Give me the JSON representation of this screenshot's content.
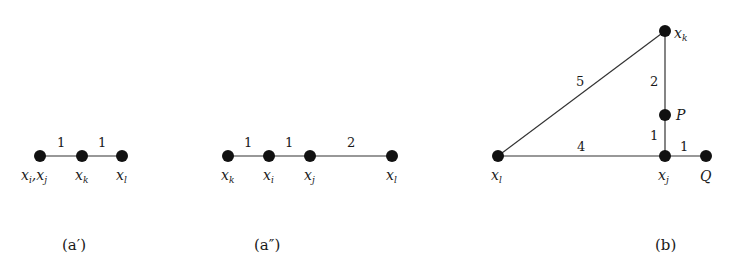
{
  "figures": [
    {
      "id": "a_prime",
      "caption": "(a′)",
      "caption_pos": [
        75,
        246
      ],
      "nodes": [
        {
          "id": "xij",
          "x": 40,
          "y": 156,
          "label": "xi,xj",
          "label_html": [
            "x",
            "i",
            ",x",
            "j"
          ],
          "lx": 22,
          "ly": 178
        },
        {
          "id": "xk",
          "x": 82,
          "y": 156,
          "label": "xk",
          "lx": 76,
          "ly": 178
        },
        {
          "id": "xl",
          "x": 122,
          "y": 156,
          "label": "xl",
          "lx": 116,
          "ly": 178
        }
      ],
      "edges": [
        {
          "from": "xij",
          "to": "xk",
          "weight": "1",
          "wx": 61,
          "wy": 148
        },
        {
          "from": "xk",
          "to": "xl",
          "weight": "1",
          "wx": 102,
          "wy": 148
        }
      ]
    },
    {
      "id": "a_double_prime",
      "caption": "(a″)",
      "caption_pos": [
        268,
        246
      ],
      "nodes": [
        {
          "id": "xk",
          "x": 228,
          "y": 156,
          "label": "xk",
          "lx": 221,
          "ly": 178
        },
        {
          "id": "xi",
          "x": 269,
          "y": 156,
          "label": "xi",
          "lx": 263,
          "ly": 178
        },
        {
          "id": "xj",
          "x": 310,
          "y": 156,
          "label": "xj",
          "lx": 303,
          "ly": 178
        },
        {
          "id": "xl",
          "x": 392,
          "y": 156,
          "label": "xl",
          "lx": 386,
          "ly": 178
        }
      ],
      "edges": [
        {
          "from": "xk",
          "to": "xi",
          "weight": "1",
          "wx": 248,
          "wy": 148
        },
        {
          "from": "xi",
          "to": "xj",
          "weight": "1",
          "wx": 289,
          "wy": 148
        },
        {
          "from": "xj",
          "to": "xl",
          "weight": "2",
          "wx": 350,
          "wy": 148
        }
      ]
    },
    {
      "id": "b",
      "caption": "(b)",
      "caption_pos": [
        663,
        246
      ],
      "nodes": [
        {
          "id": "xk",
          "x": 665,
          "y": 31,
          "label": "xk",
          "lx": 675,
          "ly": 36
        },
        {
          "id": "P",
          "x": 665,
          "y": 115,
          "label": "P",
          "lx": 676,
          "ly": 120
        },
        {
          "id": "xj",
          "x": 665,
          "y": 156,
          "label": "xj",
          "lx": 658,
          "ly": 178
        },
        {
          "id": "Q",
          "x": 706,
          "y": 156,
          "label": "Q",
          "lx": 700,
          "ly": 178
        },
        {
          "id": "xl",
          "x": 498,
          "y": 156,
          "label": "xl",
          "lx": 491,
          "ly": 178
        }
      ],
      "edges": [
        {
          "from": "xl",
          "to": "xk",
          "weight": "5",
          "wx": 578,
          "wy": 84
        },
        {
          "from": "xk",
          "to": "P",
          "weight": "2",
          "wx": 651,
          "wy": 86
        },
        {
          "from": "P",
          "to": "xj",
          "weight": "1",
          "wx": 651,
          "wy": 140
        },
        {
          "from": "xl",
          "to": "xj",
          "weight": "4",
          "wx": 578,
          "wy": 150
        },
        {
          "from": "xj",
          "to": "Q",
          "weight": "1",
          "wx": 682,
          "wy": 150
        }
      ]
    }
  ],
  "labels": {
    "a_prime": {
      "n1": "x",
      "n1s": "i",
      "n1b": ",x",
      "n1bs": "j",
      "n2": "x",
      "n2s": "k",
      "n3": "x",
      "n3s": "l"
    },
    "a_double_prime": {
      "n1": "x",
      "n1s": "k",
      "n2": "x",
      "n2s": "i",
      "n3": "x",
      "n3s": "j",
      "n4": "x",
      "n4s": "l"
    },
    "b": {
      "xk": "x",
      "xks": "k",
      "P": "P",
      "xj": "x",
      "xjs": "j",
      "Q": "Q",
      "xl": "x",
      "xls": "l"
    }
  },
  "weights": {
    "a_prime": [
      "1",
      "1"
    ],
    "a_double_prime": [
      "1",
      "1",
      "2"
    ],
    "b": [
      "5",
      "2",
      "1",
      "4",
      "1"
    ]
  },
  "captions": {
    "a_prime": "(a′)",
    "a_double_prime": "(a″)",
    "b": "(b)"
  }
}
